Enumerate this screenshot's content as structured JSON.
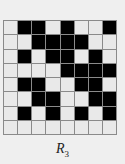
{
  "figure": {
    "label_main": "R",
    "label_sub": "3",
    "rows": 8,
    "cols": 8,
    "colors": {
      "filled": "#000000",
      "empty": "#e9e9e9",
      "grid_line": "#8a8a8a",
      "background": "#efefef"
    },
    "grid": [
      [
        0,
        1,
        1,
        0,
        1,
        0,
        0,
        1
      ],
      [
        0,
        0,
        1,
        1,
        1,
        1,
        0,
        0
      ],
      [
        0,
        1,
        0,
        1,
        1,
        0,
        1,
        0
      ],
      [
        0,
        0,
        0,
        0,
        1,
        1,
        1,
        1
      ],
      [
        0,
        1,
        1,
        0,
        0,
        1,
        1,
        0
      ],
      [
        0,
        0,
        1,
        1,
        0,
        0,
        1,
        1
      ],
      [
        0,
        1,
        0,
        1,
        0,
        1,
        0,
        1
      ],
      [
        0,
        0,
        0,
        0,
        0,
        0,
        0,
        0
      ]
    ]
  }
}
